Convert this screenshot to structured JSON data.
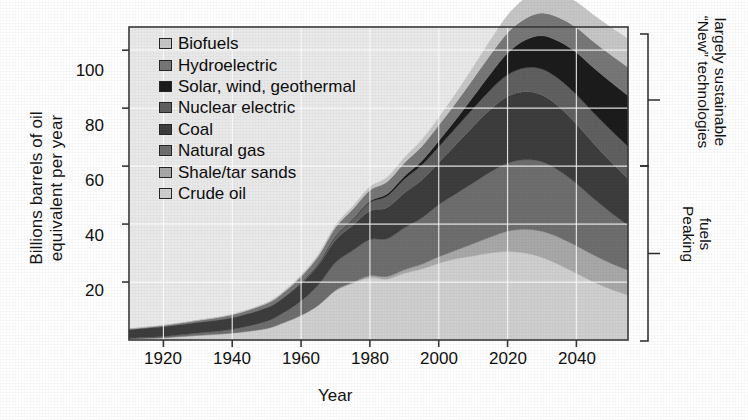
{
  "chart_data": {
    "type": "area",
    "title": "",
    "xlabel": "Year",
    "ylabel_line1": "Billions barrels of oil",
    "ylabel_line2": "equivalent per year",
    "xlim": [
      1910,
      2055
    ],
    "ylim": [
      0,
      108
    ],
    "xticks": [
      1920,
      1940,
      1960,
      1980,
      2000,
      2020,
      2040
    ],
    "yticks": [
      20,
      40,
      60,
      80,
      100
    ],
    "grid": true,
    "legend_position": "inside-top-left",
    "stacking": "bottom-to-top: Crude oil, Shale/tar sands, Natural gas, Coal, Nuclear electric, Solar wind geothermal, Hydroelectric, Biofuels",
    "x": [
      1910,
      1920,
      1930,
      1940,
      1950,
      1955,
      1960,
      1965,
      1970,
      1975,
      1980,
      1985,
      1990,
      1995,
      2000,
      2005,
      2010,
      2015,
      2020,
      2025,
      2030,
      2035,
      2040,
      2045,
      2050,
      2055
    ],
    "series": [
      {
        "name": "Crude oil",
        "color": "#cfcfcf",
        "values": [
          0.4,
          0.8,
          1.6,
          2.4,
          4.0,
          6.0,
          8.5,
          12.0,
          17.0,
          19.5,
          21.5,
          21.0,
          23.0,
          24.5,
          26.5,
          28.0,
          29.0,
          30.0,
          30.5,
          30.0,
          28.5,
          26.0,
          23.0,
          20.0,
          17.5,
          15.5
        ]
      },
      {
        "name": "Shale/tar sands",
        "color": "#a8a8a8",
        "values": [
          0.0,
          0.0,
          0.0,
          0.0,
          0.0,
          0.0,
          0.0,
          0.0,
          0.2,
          0.4,
          0.7,
          0.9,
          1.2,
          1.6,
          2.2,
          3.0,
          4.2,
          5.5,
          7.0,
          8.2,
          9.0,
          9.4,
          9.5,
          9.3,
          9.0,
          8.6
        ]
      },
      {
        "name": "Natural gas",
        "color": "#6e6e6e",
        "values": [
          0.2,
          0.4,
          0.8,
          1.3,
          2.5,
          3.5,
          5.0,
          7.0,
          9.5,
          11.0,
          12.5,
          13.0,
          14.5,
          16.0,
          18.0,
          19.5,
          21.0,
          22.5,
          23.5,
          24.0,
          24.0,
          23.0,
          21.5,
          19.5,
          17.5,
          15.5
        ]
      },
      {
        "name": "Coal",
        "color": "#3d3d3d",
        "values": [
          3.0,
          3.4,
          3.6,
          4.0,
          4.6,
          5.2,
          6.0,
          6.8,
          7.8,
          8.6,
          9.8,
          10.8,
          12.0,
          13.0,
          14.5,
          17.0,
          19.5,
          21.5,
          23.0,
          23.5,
          23.0,
          22.0,
          20.5,
          19.0,
          17.5,
          16.0
        ]
      },
      {
        "name": "Nuclear electric",
        "color": "#606060",
        "values": [
          0.0,
          0.0,
          0.0,
          0.0,
          0.0,
          0.0,
          0.2,
          0.5,
          1.2,
          2.0,
          3.0,
          4.0,
          4.8,
          5.2,
          5.5,
          5.8,
          6.2,
          6.8,
          7.5,
          8.2,
          9.0,
          9.6,
          10.2,
          10.6,
          11.0,
          11.2
        ]
      },
      {
        "name": "Solar, wind, geothermal",
        "color": "#1c1c1c",
        "values": [
          0.0,
          0.0,
          0.0,
          0.0,
          0.0,
          0.0,
          0.0,
          0.0,
          0.1,
          0.2,
          0.4,
          0.7,
          1.0,
          1.4,
          2.0,
          2.8,
          4.0,
          5.5,
          7.5,
          9.5,
          11.5,
          13.0,
          14.5,
          15.5,
          16.5,
          17.5
        ]
      },
      {
        "name": "Hydroelectric",
        "color": "#777777",
        "values": [
          0.2,
          0.4,
          0.7,
          1.0,
          1.5,
          1.8,
          2.2,
          2.6,
          3.0,
          3.4,
          3.8,
          4.2,
          4.6,
          5.0,
          5.4,
          5.8,
          6.2,
          6.6,
          7.0,
          7.4,
          7.8,
          8.2,
          8.6,
          9.0,
          9.4,
          9.8
        ]
      },
      {
        "name": "Biofuels",
        "color": "#c6c6c6",
        "values": [
          0.1,
          0.1,
          0.2,
          0.2,
          0.3,
          0.4,
          0.5,
          0.6,
          0.8,
          1.0,
          1.2,
          1.5,
          1.8,
          2.2,
          2.6,
          3.2,
          4.0,
          5.0,
          6.0,
          7.0,
          7.8,
          8.4,
          8.8,
          9.2,
          9.5,
          9.8
        ]
      }
    ]
  },
  "legend": {
    "items": [
      {
        "label": "Biofuels",
        "color": "#c6c6c6"
      },
      {
        "label": "Hydroelectric",
        "color": "#777777"
      },
      {
        "label": "Solar, wind, geothermal",
        "color": "#1c1c1c"
      },
      {
        "label": "Nuclear electric",
        "color": "#606060"
      },
      {
        "label": "Coal",
        "color": "#3d3d3d"
      },
      {
        "label": "Natural gas",
        "color": "#6e6e6e"
      },
      {
        "label": "Shale/tar sands",
        "color": "#a8a8a8"
      },
      {
        "label": "Crude oil",
        "color": "#cfcfcf"
      }
    ]
  },
  "annotations": {
    "bracket_top": {
      "line1": "“New” technologies",
      "line2": "largely sustainable"
    },
    "bracket_bottom": {
      "line1": "Peaking",
      "line2": "fuels"
    }
  },
  "axes": {
    "y_title_line1": "Billions barrels of oil",
    "y_title_line2": "equivalent per year",
    "x_title": "Year",
    "yticks": [
      "20",
      "40",
      "60",
      "80",
      "100"
    ],
    "xticks": [
      "1920",
      "1940",
      "1960",
      "1980",
      "2000",
      "2020",
      "2040"
    ]
  },
  "colors": {
    "plot_background": "#e9e9e9",
    "frame": "#3a3a3a",
    "grid": "#ffffff",
    "text": "#111111"
  }
}
